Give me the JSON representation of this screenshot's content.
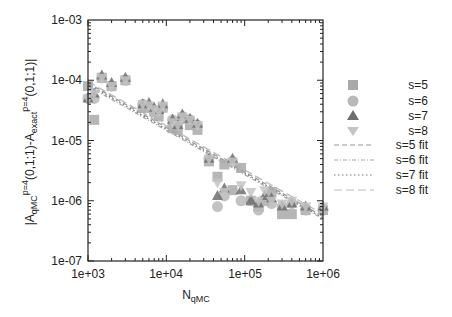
{
  "chart_data": {
    "type": "scatter",
    "title": "",
    "xlabel": "N_qMC",
    "ylabel": "|A_qMC^{p=4}(0,1;1)-A_exact^{p=4}(0,1;1)|",
    "xscale": "log",
    "yscale": "log",
    "xlim": [
      1000,
      1000000
    ],
    "ylim": [
      1e-07,
      0.001
    ],
    "x_tick_labels": [
      "1e+03",
      "1e+04",
      "1e+05",
      "1e+06"
    ],
    "y_tick_labels": [
      "1e-03",
      "1e-04",
      "1e-05",
      "1e-06",
      "1e-07"
    ],
    "grid": false,
    "legend_position": "right-outside",
    "legend": [
      "s=5",
      "s=6",
      "s=7",
      "s=8",
      "s=5 fit",
      "s=6 fit",
      "s=7 fit",
      "s=8 fit"
    ],
    "x": [
      1000,
      1200,
      1500,
      2000,
      3000,
      5000,
      6000,
      7000,
      8000,
      9000,
      12000,
      14000,
      16000,
      20000,
      25000,
      35000,
      45000,
      55000,
      70000,
      90000,
      120000,
      150000,
      180000,
      220000,
      300000,
      400000,
      600000,
      1000000
    ],
    "series": [
      {
        "name": "s=5",
        "marker": "square",
        "values": [
          8e-05,
          2.2e-05,
          0.00011,
          8e-05,
          0.0001,
          3.5e-05,
          3.5e-05,
          3e-05,
          2.5e-05,
          3.5e-05,
          1.6e-05,
          1.5e-05,
          2.3e-05,
          1.8e-05,
          1.5e-05,
          4.5e-06,
          2.5e-06,
          4e-06,
          1.5e-06,
          3.5e-06,
          1e-06,
          8e-07,
          1e-06,
          1.4e-06,
          6e-07,
          6e-07,
          7e-07,
          7e-07
        ]
      },
      {
        "name": "s=6",
        "marker": "circle",
        "values": [
          5e-05,
          5e-05,
          0.00011,
          8e-05,
          0.0001,
          4e-05,
          3.5e-05,
          3e-05,
          3e-05,
          3.5e-05,
          2.2e-05,
          1.9e-05,
          2.5e-05,
          2.2e-05,
          1.8e-05,
          5e-06,
          8e-07,
          1.2e-06,
          4.5e-06,
          1e-06,
          1e-06,
          7e-07,
          1e-06,
          9e-07,
          8e-07,
          9e-07,
          7e-07,
          7e-07
        ]
      },
      {
        "name": "s=7",
        "marker": "triangle-up",
        "values": [
          5e-05,
          6e-05,
          0.00012,
          9e-05,
          0.00011,
          4e-05,
          4.2e-05,
          3.5e-05,
          3.2e-05,
          4e-05,
          2.2e-05,
          1.8e-05,
          2.7e-05,
          2.3e-05,
          1.9e-05,
          5e-06,
          1.2e-06,
          1.6e-06,
          5e-06,
          1.5e-06,
          1e-06,
          9e-07,
          1.2e-06,
          1.1e-06,
          8e-07,
          9e-07,
          8e-07,
          8e-07
        ]
      },
      {
        "name": "s=8",
        "marker": "triangle-down",
        "values": [
          5e-05,
          6e-05,
          0.00011,
          8e-05,
          0.0001,
          4e-05,
          3.8e-05,
          3.3e-05,
          3e-05,
          3.8e-05,
          2e-05,
          1.8e-05,
          2.5e-05,
          2.2e-05,
          1.8e-05,
          5e-06,
          2e-06,
          1.4e-06,
          4.5e-06,
          1.8e-06,
          1.4e-06,
          1e-06,
          1.5e-06,
          1e-06,
          9e-07,
          1e-06,
          8e-07,
          8e-07
        ]
      }
    ],
    "fits": [
      {
        "name": "s=5 fit",
        "style": "dashed",
        "x": [
          1000,
          1000000
        ],
        "y": [
          9e-05,
          5.5e-07
        ]
      },
      {
        "name": "s=6 fit",
        "style": "dash-dot",
        "x": [
          1000,
          1000000
        ],
        "y": [
          8e-05,
          5e-07
        ]
      },
      {
        "name": "s=7 fit",
        "style": "dotted",
        "x": [
          1000,
          1000000
        ],
        "y": [
          8.5e-05,
          5.2e-07
        ]
      },
      {
        "name": "s=8 fit",
        "style": "long-dash",
        "x": [
          1000,
          1000000
        ],
        "y": [
          9.5e-05,
          6e-07
        ]
      }
    ]
  },
  "axes": {
    "x_title_main": "N",
    "x_title_sub": "qMC",
    "y_title_parts": {
      "bar_open": "|A",
      "sub1": "qMC",
      "sup1": "p=4",
      "mid": "(0,1;1)-A",
      "sub2": "exact",
      "sup2": "p=4",
      "end": "(0,1;1)|"
    }
  },
  "colors": {
    "s5": "#a9a9a9",
    "s6": "#b8b8b8",
    "s7": "#6e6e6e",
    "s8": "#c4c4c4",
    "fit5": "#9a9a9a",
    "fit6": "#aaaaaa",
    "fit7": "#7a7a7a",
    "fit8": "#bbbbbb",
    "axis": "#222222"
  }
}
